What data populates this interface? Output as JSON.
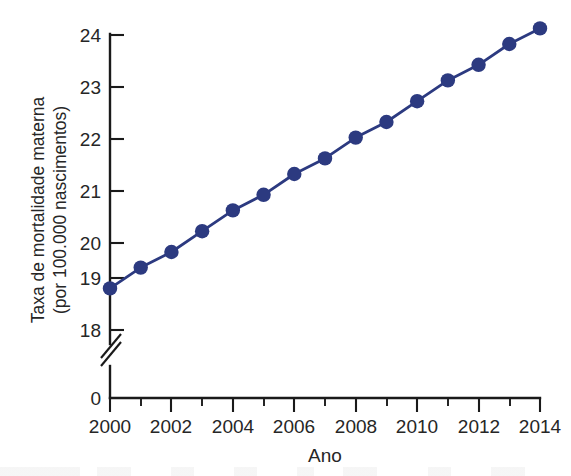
{
  "chart_data": {
    "type": "line",
    "title": "",
    "subtitle": "",
    "xlabel": "Ano",
    "ylabel": "Taxa de mortalidade materna\n(por 100.000 nascimentos)",
    "ylabel_line1": "Taxa de mortalidade materna",
    "ylabel_line2": "(por 100.000 nascimentos)",
    "x": [
      2000,
      2001,
      2002,
      2003,
      2004,
      2005,
      2006,
      2007,
      2008,
      2009,
      2010,
      2011,
      2012,
      2013,
      2014
    ],
    "values": [
      18.8,
      19.2,
      19.5,
      19.9,
      20.3,
      20.6,
      21.0,
      21.3,
      21.7,
      22.0,
      22.4,
      22.8,
      23.1,
      23.5,
      23.8
    ],
    "series": [
      {
        "name": "Taxa de mortalidade materna",
        "values": [
          18.8,
          19.2,
          19.5,
          19.9,
          20.3,
          20.6,
          21.0,
          21.3,
          21.7,
          22.0,
          22.4,
          22.8,
          23.1,
          23.5,
          23.8
        ],
        "color": "#2c3a80",
        "marker": "circle"
      }
    ],
    "xlim": [
      2000,
      2014
    ],
    "ylim": [
      18,
      24
    ],
    "ytick_labels": [
      "18",
      "19",
      "20",
      "21",
      "22",
      "23",
      "24"
    ],
    "yticks": [
      18,
      19,
      20,
      21,
      22,
      23,
      24
    ],
    "xtick_labels": [
      "2000",
      "2002",
      "2004",
      "2006",
      "2008",
      "2010",
      "2012",
      "2014"
    ],
    "xticks": [
      2000,
      2002,
      2004,
      2006,
      2008,
      2010,
      2012,
      2014
    ],
    "x_minor_ticks": [
      2001,
      2003,
      2005,
      2007,
      2009,
      2011,
      2013
    ],
    "origin_label": "0",
    "axis_break": true,
    "grid": false,
    "legend": "none",
    "legend_position": "none",
    "annotations": [],
    "line_color": "#2c3a80",
    "marker_color": "#2c3a80",
    "axis_color": "#1a1a1a",
    "background_color": "#ffffff"
  },
  "figure": {
    "name": "maternal-mortality-rate-line-chart"
  }
}
